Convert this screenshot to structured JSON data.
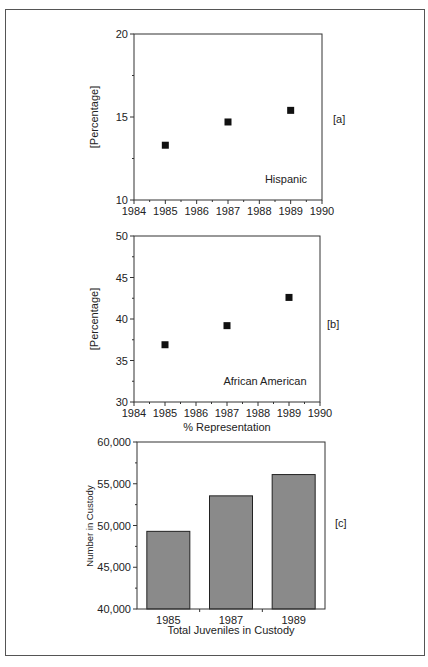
{
  "figure": {
    "panels": [
      "[a]",
      "[b]",
      "[c]"
    ]
  },
  "chart_data": [
    {
      "type": "scatter",
      "panel_label": "[a]",
      "annotation": "Hispanic",
      "title": "",
      "xlabel": "",
      "ylabel": "[Percentage]",
      "xlim": [
        1984,
        1990
      ],
      "ylim": [
        10,
        20
      ],
      "xticks": [
        "1984",
        "1985",
        "1986",
        "1987",
        "1988",
        "1989",
        "1990"
      ],
      "yticks": [
        "10",
        "15",
        "20"
      ],
      "grid": false,
      "x": [
        1985,
        1987,
        1989
      ],
      "y": [
        13.3,
        14.7,
        15.4
      ],
      "marker": "square"
    },
    {
      "type": "scatter",
      "panel_label": "[b]",
      "annotation": "African American",
      "title": "",
      "xlabel": "% Representation",
      "ylabel": "[Percentage]",
      "xlim": [
        1984,
        1990
      ],
      "ylim": [
        30,
        50
      ],
      "xticks": [
        "1984",
        "1985",
        "1986",
        "1987",
        "1988",
        "1989",
        "1990"
      ],
      "yticks": [
        "30",
        "35",
        "40",
        "45",
        "50"
      ],
      "grid": false,
      "x": [
        1985,
        1987,
        1989
      ],
      "y": [
        36.9,
        39.2,
        42.6
      ],
      "marker": "square"
    },
    {
      "type": "bar",
      "panel_label": "[c]",
      "title": "",
      "xlabel": "Total Juveniles in Custody",
      "ylabel": "Number in Custody",
      "categories": [
        "1985",
        "1987",
        "1989"
      ],
      "values": [
        49300,
        53550,
        56100
      ],
      "ylim": [
        40000,
        60000
      ],
      "yticks": [
        "40,000",
        "45,000",
        "50,000",
        "55,000",
        "60,000"
      ],
      "grid": false,
      "bar_color": "#8a8a8a"
    }
  ]
}
